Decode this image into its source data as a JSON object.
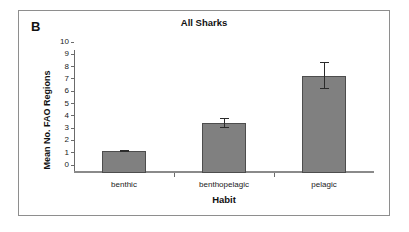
{
  "figure": {
    "panel_label": "B"
  },
  "chart_data": {
    "type": "bar",
    "title": "All Sharks",
    "xlabel": "Habit",
    "ylabel": "Mean No. FAO Regions",
    "categories": [
      "benthic",
      "benthopelagic",
      "pelagic"
    ],
    "values": [
      1.75,
      4.05,
      7.9
    ],
    "errors": [
      0.08,
      0.35,
      1.05
    ],
    "ylim": [
      0,
      10
    ],
    "ytick_labels": [
      "0",
      "1",
      "2",
      "3",
      "4",
      "5",
      "6",
      "7",
      "8",
      "9",
      "10"
    ],
    "ytick_values": [
      0,
      1,
      2,
      3,
      4,
      5,
      6,
      7,
      8,
      9,
      10
    ],
    "grid": false,
    "legend": null,
    "bar_color": "#808080",
    "bar_edge_color": "#4d4d4d",
    "error_color": "#2b2b2b",
    "axis_color": "#6b6b6b",
    "frame_color": "#8e8e8e",
    "text_color": "#111111"
  }
}
